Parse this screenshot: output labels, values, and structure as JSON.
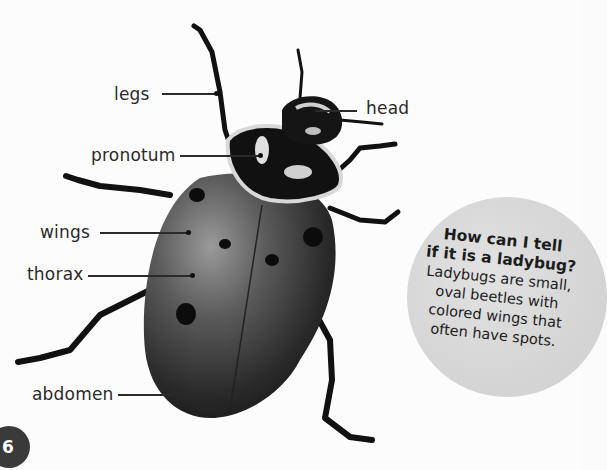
{
  "diagram": {
    "subject": "ladybug",
    "labels": [
      {
        "id": "legs",
        "text": "legs"
      },
      {
        "id": "head",
        "text": "head"
      },
      {
        "id": "pronotum",
        "text": "pronotum"
      },
      {
        "id": "wings",
        "text": "wings"
      },
      {
        "id": "thorax",
        "text": "thorax"
      },
      {
        "id": "abdomen",
        "text": "abdomen"
      }
    ]
  },
  "callout": {
    "title_line1": "How can I tell",
    "title_line2": "if it is a ladybug?",
    "body_line1": "Ladybugs are small,",
    "body_line2": "oval beetles with",
    "body_line3": "colored wings that",
    "body_line4": "often have spots."
  },
  "page": {
    "number": "6"
  },
  "colors": {
    "background": "#fcfcfc",
    "text": "#2a2a2a",
    "bubble": "#d6d6d6",
    "page_badge": "#3a3a3a"
  }
}
